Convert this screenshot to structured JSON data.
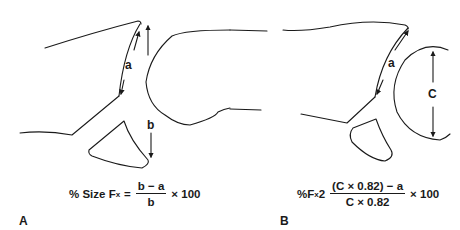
{
  "panels": [
    {
      "id": "A",
      "panel_label": "A",
      "measure_labels": {
        "a": "a",
        "b": "b"
      },
      "formula": {
        "prefix": "% Size F",
        "subscript": "x",
        "equals": "=",
        "numerator": "b − a",
        "denominator": "b",
        "suffix": "× 100"
      }
    },
    {
      "id": "B",
      "panel_label": "B",
      "measure_labels": {
        "a": "a",
        "c": "C"
      },
      "formula": {
        "prefix": "%F",
        "subscript": "x",
        "equals": "2",
        "numerator": "(C × 0.82) − a",
        "denominator": "C × 0.82",
        "suffix": "× 100"
      }
    }
  ],
  "colors": {
    "stroke": "#1a1a1a",
    "background": "#ffffff"
  }
}
